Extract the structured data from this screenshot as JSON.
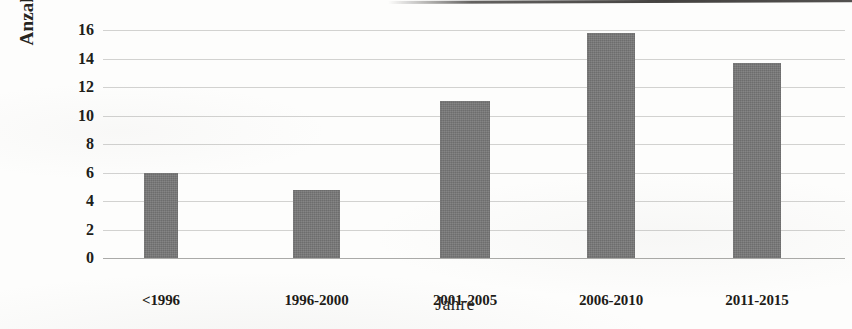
{
  "chart_data": {
    "type": "bar",
    "title": "",
    "subtitle": "",
    "xlabel": "Jahre",
    "ylabel": "Anzahl Veröffentlichungen",
    "categories": [
      "<1996",
      "1996-2000",
      "2001-2005",
      "2006-2010",
      "2011-2015"
    ],
    "values": [
      6,
      4.8,
      11,
      15.8,
      13.7
    ],
    "series": [
      {
        "name": "Anzahl Veröffentlichungen",
        "values": [
          6,
          4.8,
          11,
          15.8,
          13.7
        ]
      }
    ],
    "ylim": [
      0,
      16
    ],
    "ytick_labels": [
      "0",
      "2",
      "4",
      "6",
      "8",
      "10",
      "12",
      "14",
      "16"
    ],
    "ytick_values": [
      0,
      2,
      4,
      6,
      8,
      10,
      12,
      14,
      16
    ],
    "grid": true,
    "legend": "none",
    "bar_color": "#787878",
    "gridline_color": "#969694",
    "text_color": "#201e1a",
    "background_color": "#ffffff"
  },
  "axes": {
    "y_title": "Anzahl Veröffentlichungen",
    "x_title": "Jahre"
  }
}
